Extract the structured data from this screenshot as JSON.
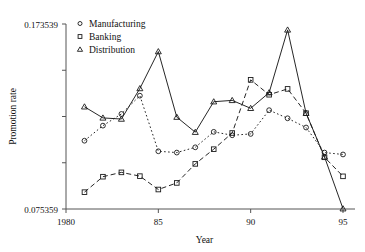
{
  "chart_data": {
    "type": "line",
    "title": "",
    "xlabel": "Year",
    "ylabel": "Promotion rate",
    "x": [
      1981,
      1982,
      1983,
      1984,
      1985,
      1986,
      1987,
      1988,
      1989,
      1990,
      1991,
      1992,
      1993,
      1994,
      1995
    ],
    "xlim": [
      1980,
      1995
    ],
    "ylim": [
      0.075359,
      0.173539
    ],
    "xticks": [
      1980,
      1985,
      1990,
      1995
    ],
    "xtick_labels": [
      "1980",
      "85",
      "90",
      "95"
    ],
    "yticks": [
      0.075359,
      0.173539
    ],
    "ytick_labels": [
      "0.075359",
      "0.173539"
    ],
    "grid": false,
    "legend_position": "top-left",
    "series": [
      {
        "name": "Manufacturing",
        "marker": "circle",
        "linestyle": "dotted",
        "values": [
          0.1116,
          0.1196,
          0.1258,
          0.1355,
          0.106,
          0.1053,
          0.1081,
          0.1163,
          0.1145,
          0.1152,
          0.1278,
          0.1235,
          0.1186,
          0.1053,
          0.1043
        ]
      },
      {
        "name": "Banking",
        "marker": "square",
        "linestyle": "dashed",
        "values": [
          0.0843,
          0.0925,
          0.0948,
          0.0928,
          0.0857,
          0.0892,
          0.0993,
          0.1071,
          0.1157,
          0.1439,
          0.136,
          0.1391,
          0.1262,
          0.1028,
          0.0927
        ]
      },
      {
        "name": "Distribution",
        "marker": "triangle",
        "linestyle": "solid",
        "values": [
          0.1296,
          0.1237,
          0.1231,
          0.1393,
          0.1589,
          0.1241,
          0.1161,
          0.1323,
          0.133,
          0.1288,
          0.1371,
          0.1704,
          0.1262,
          0.103,
          0.0755
        ]
      }
    ]
  },
  "legend": {
    "items": [
      {
        "label": "Manufacturing",
        "marker": "circle"
      },
      {
        "label": "Banking",
        "marker": "square"
      },
      {
        "label": "Distribution",
        "marker": "triangle"
      }
    ]
  },
  "axes": {
    "y_top_label": "0.173539",
    "y_bottom_label": "0.075359",
    "y_title": "Promotion rate",
    "x_title": "Year",
    "x_labels": [
      "1980",
      "85",
      "90",
      "95"
    ]
  }
}
